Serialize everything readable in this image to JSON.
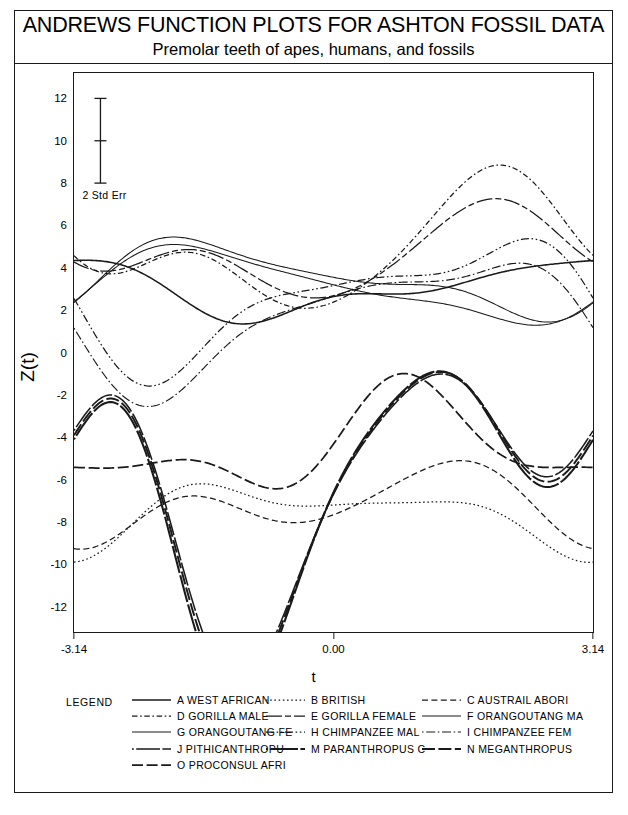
{
  "title": "ANDREWS FUNCTION PLOTS FOR ASHTON FOSSIL DATA",
  "subtitle": "Premolar teeth of apes, humans, and fossils",
  "annotation": {
    "errorbar_label": "2 Std Err",
    "errorbar_top": 12,
    "errorbar_mid": 10,
    "errorbar_bottom": 8,
    "errorbar_t": -2.82
  },
  "legend": {
    "title": "LEGEND",
    "columns": [
      [
        {
          "code": "A",
          "label": "A WEST AFRICAN",
          "style": "solid"
        },
        {
          "code": "D",
          "label": "D GORILLA MALE",
          "style": "dashdot-short"
        },
        {
          "code": "G",
          "label": "G ORANGOUTANG FE",
          "style": "solid-thin"
        },
        {
          "code": "J",
          "label": "J PITHICANTHROPU",
          "style": "dot-solid"
        },
        {
          "code": "O",
          "label": "O PROCONSUL AFRI",
          "style": "dash-long"
        }
      ],
      [
        {
          "code": "B",
          "label": "B BRITISH",
          "style": "dotted"
        },
        {
          "code": "E",
          "label": "E GORILLA FEMALE",
          "style": "solid-dash"
        },
        {
          "code": "H",
          "label": "H CHIMPANZEE MAL",
          "style": "dashdotdot"
        },
        {
          "code": "M",
          "label": "M PARANTHROPUS C",
          "style": "dot-solid-bold"
        }
      ],
      [
        {
          "code": "C",
          "label": "C AUSTRAIL ABORI",
          "style": "dashed"
        },
        {
          "code": "F",
          "label": "F ORANGOUTANG MA",
          "style": "solid-thin"
        },
        {
          "code": "I",
          "label": "I CHIMPANZEE FEM",
          "style": "dot-dash-dot"
        },
        {
          "code": "N",
          "label": "N MEGANTHROPUS",
          "style": "dash-bold"
        }
      ]
    ]
  },
  "chart_data": {
    "type": "line",
    "title": "ANDREWS FUNCTION PLOTS FOR ASHTON FOSSIL DATA",
    "subtitle": "Premolar teeth of apes, humans, and fossils",
    "xlabel": "t",
    "ylabel": "Z(t)",
    "xlim": [
      -3.14,
      3.14
    ],
    "ylim": [
      -13.2,
      13.2
    ],
    "xticks": [
      -3.14,
      0.0,
      3.14
    ],
    "xtick_labels": [
      "-3.14",
      "0.00",
      "3.14"
    ],
    "yticks": [
      12,
      10,
      8,
      6,
      4,
      2,
      0,
      -2,
      -4,
      -6,
      -8,
      -10,
      -12
    ],
    "ytick_labels": [
      "12",
      "10",
      "8",
      "6",
      "4",
      "2",
      "0",
      "-2",
      "-4",
      "-6",
      "-8",
      "-10",
      "-12"
    ],
    "grid": false,
    "legend_position": "bottom",
    "basis": "andrews",
    "basis_note": "Z(t) = c0/sqrt(2) + c1*sin(t) + c2*cos(t) + c3*sin(2t) + c4*cos(2t) + c5*sin(3t) + c6*cos(3t)",
    "series": [
      {
        "name": "A WEST AFRICAN",
        "code": "A",
        "style": "solid",
        "coefficients": [
          4.3,
          0.6,
          -1.05,
          0.25,
          0.45,
          -0.1,
          0.2
        ]
      },
      {
        "name": "B BRITISH",
        "code": "B",
        "style": "dotted",
        "coefficients": [
          -10.75,
          -0.35,
          1.05,
          0.15,
          -0.95,
          0.1,
          0.3
        ]
      },
      {
        "name": "C AUSTRAIL ABORI",
        "code": "C",
        "style": "dashed",
        "coefficients": [
          -10.2,
          0.9,
          0.55,
          0.2,
          -1.25,
          0.05,
          0.25
        ]
      },
      {
        "name": "D GORILLA MALE",
        "code": "D",
        "style": "dashdot-short",
        "coefficients": [
          6.9,
          1.95,
          -1.45,
          -0.55,
          -1.4,
          0.25,
          0.35
        ]
      },
      {
        "name": "E GORILLA FEMALE",
        "code": "E",
        "style": "solid-dash",
        "coefficients": [
          6.55,
          1.15,
          -1.0,
          -0.35,
          -1.15,
          0.15,
          0.2
        ]
      },
      {
        "name": "F ORANGOUTANG MA",
        "code": "F",
        "style": "solid-thin",
        "coefficients": [
          4.95,
          -1.35,
          0.45,
          0.6,
          -0.55,
          -0.2,
          0.15
        ]
      },
      {
        "name": "G ORANGOUTANG FE",
        "code": "G",
        "style": "solid-thin",
        "coefficients": [
          4.45,
          -1.55,
          0.3,
          0.5,
          -0.35,
          -0.15,
          0.1
        ]
      },
      {
        "name": "H CHIMPANZEE MAL",
        "code": "H",
        "style": "dashdotdot",
        "coefficients": [
          3.55,
          2.35,
          0.55,
          -1.45,
          0.35,
          0.45,
          -0.25
        ]
      },
      {
        "name": "I CHIMPANZEE FEM",
        "code": "I",
        "style": "dot-dash-dot",
        "coefficients": [
          2.35,
          2.55,
          0.95,
          -1.25,
          0.25,
          0.4,
          -0.2
        ]
      },
      {
        "name": "J PITHICANTHROPU",
        "code": "J",
        "style": "dot-solid",
        "coefficients": [
          -8.9,
          4.7,
          -2.05,
          3.45,
          1.1,
          -1.25,
          0.55
        ]
      },
      {
        "name": "M PARANTHROPUS C",
        "code": "M",
        "style": "dot-solid-bold",
        "coefficients": [
          -9.35,
          5.1,
          -1.85,
          3.65,
          1.25,
          -1.35,
          0.6
        ]
      },
      {
        "name": "N MEGANTHROPUS",
        "code": "N",
        "style": "dash-bold",
        "coefficients": [
          -9.1,
          4.9,
          -1.95,
          3.55,
          1.15,
          -1.3,
          0.58
        ]
      },
      {
        "name": "O PROCONSUL AFRI",
        "code": "O",
        "style": "dash-long",
        "coefficients": [
          -6.4,
          1.45,
          0.85,
          1.35,
          -0.35,
          0.45,
          -0.3
        ]
      }
    ]
  }
}
